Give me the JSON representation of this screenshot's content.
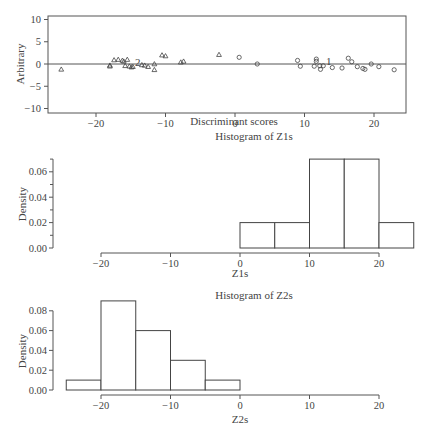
{
  "chart_data": [
    {
      "type": "scatter",
      "title": "",
      "xlabel": "Discriminant scores",
      "ylabel": "Arbitrary",
      "xlim": [
        -26,
        25.5
      ],
      "ylim": [
        -11,
        11
      ],
      "xticks": [
        -20,
        -10,
        0,
        10,
        20
      ],
      "yticks": [
        -10,
        -5,
        0,
        5,
        10
      ],
      "xtick_labels": [
        "−20",
        "−10",
        "0",
        "10",
        "20"
      ],
      "ytick_labels": [
        "−10",
        "−5",
        "0",
        "5",
        "10"
      ],
      "reference_line_y": 0,
      "grid": false,
      "box": true,
      "series": [
        {
          "name": "Group 2",
          "marker": "triangle",
          "label": "2",
          "label_pos": [
            -14,
            0.3
          ],
          "points": [
            [
              -25,
              -1.2
            ],
            [
              -18,
              -0.5
            ],
            [
              -18,
              -0.3
            ],
            [
              -17.4,
              0.9
            ],
            [
              -16.8,
              1.0
            ],
            [
              -16.2,
              0.8
            ],
            [
              -16,
              0.6
            ],
            [
              -15.5,
              1.0
            ],
            [
              -15.8,
              -0.4
            ],
            [
              -15.2,
              -0.5
            ],
            [
              -14.9,
              -0.7
            ],
            [
              -14.7,
              -0.6
            ],
            [
              -13.4,
              -0.2
            ],
            [
              -13,
              -0.3
            ],
            [
              -12.5,
              -0.6
            ],
            [
              -11.6,
              0
            ],
            [
              -11.6,
              -1.3
            ],
            [
              -10.5,
              2.0
            ],
            [
              -10,
              1.8
            ],
            [
              -7.8,
              0.4
            ],
            [
              -7.4,
              0.6
            ],
            [
              -2.3,
              2.1
            ]
          ]
        },
        {
          "name": "Group 1",
          "marker": "circle",
          "label": "1",
          "label_pos": [
            13.5,
            0.4
          ],
          "points": [
            [
              0.6,
              1.5
            ],
            [
              3.2,
              0
            ],
            [
              9,
              0.8
            ],
            [
              9.4,
              -0.5
            ],
            [
              11.4,
              -0.5
            ],
            [
              11.7,
              1.1
            ],
            [
              11.7,
              0.6
            ],
            [
              12.2,
              -0.4
            ],
            [
              12.3,
              -1.2
            ],
            [
              12.7,
              -0.4
            ],
            [
              14,
              -0.8
            ],
            [
              15.4,
              -0.9
            ],
            [
              16.3,
              1.3
            ],
            [
              16.8,
              0.5
            ],
            [
              17.6,
              -0.6
            ],
            [
              18.4,
              -1.0
            ],
            [
              18.7,
              -1.2
            ],
            [
              19.6,
              0
            ],
            [
              20.7,
              -0.6
            ],
            [
              22.9,
              -1.3
            ]
          ]
        }
      ]
    },
    {
      "type": "bar",
      "subtype": "histogram",
      "title": "Histogram of Z1s",
      "xlabel": "Z1s",
      "ylabel": "Density",
      "xlim": [
        -20,
        25
      ],
      "ylim": [
        0,
        0.07
      ],
      "xticks": [
        -20,
        -10,
        0,
        10,
        20
      ],
      "xtick_labels": [
        "−20",
        "−10",
        "0",
        "10",
        "20"
      ],
      "yticks": [
        0.0,
        0.02,
        0.04,
        0.06
      ],
      "ytick_labels": [
        "0.00",
        "0.02",
        "0.04",
        "0.06"
      ],
      "bins": [
        [
          0,
          5
        ],
        [
          5,
          10
        ],
        [
          10,
          15
        ],
        [
          15,
          20
        ],
        [
          20,
          25
        ]
      ],
      "categories": [
        "0–5",
        "5–10",
        "10–15",
        "15–20",
        "20–25"
      ],
      "values": [
        0.02,
        0.02,
        0.07,
        0.07,
        0.02
      ]
    },
    {
      "type": "bar",
      "subtype": "histogram",
      "title": "Histogram of Z2s",
      "xlabel": "Z2s",
      "ylabel": "Density",
      "xlim": [
        -25,
        20
      ],
      "ylim": [
        0,
        0.09
      ],
      "xticks": [
        -20,
        -10,
        0,
        10,
        20
      ],
      "xtick_labels": [
        "−20",
        "−10",
        "0",
        "10",
        "20"
      ],
      "yticks": [
        0.0,
        0.02,
        0.04,
        0.06,
        0.08
      ],
      "ytick_labels": [
        "0.00",
        "0.02",
        "0.04",
        "0.06",
        "0.08"
      ],
      "bins": [
        [
          -25,
          -20
        ],
        [
          -20,
          -15
        ],
        [
          -15,
          -10
        ],
        [
          -10,
          -5
        ],
        [
          -5,
          0
        ]
      ],
      "categories": [
        "−25–−20",
        "−20–−15",
        "−15–−10",
        "−10–−5",
        "−5–0"
      ],
      "values": [
        0.01,
        0.09,
        0.06,
        0.03,
        0.01
      ]
    }
  ],
  "colors": {
    "ink": "#444444",
    "axis": "#555555",
    "background": "#ffffff"
  }
}
